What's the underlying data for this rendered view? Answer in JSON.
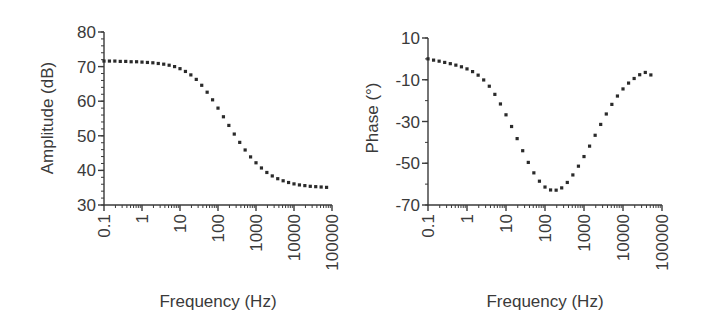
{
  "chart_data": [
    {
      "type": "scatter",
      "title": "",
      "xlabel": "Frequency (Hz)",
      "ylabel": "Amplitude (dB)",
      "xscale": "log",
      "xlim": [
        0.1,
        100000
      ],
      "ylim": [
        30,
        80
      ],
      "xticks": [
        "0.1",
        "1",
        "10",
        "100",
        "1000",
        "10000",
        "100000"
      ],
      "yticks": [
        "30",
        "40",
        "50",
        "60",
        "70",
        "80"
      ],
      "grid": false,
      "legend": null,
      "series": [
        {
          "name": "Amplitude",
          "x": [
            0.1,
            0.139,
            0.193,
            0.268,
            0.373,
            0.518,
            0.72,
            1.0,
            1.39,
            1.93,
            2.68,
            3.73,
            5.18,
            7.2,
            10.0,
            13.9,
            19.3,
            26.8,
            37.3,
            51.8,
            72.0,
            100,
            139,
            193,
            268,
            373,
            518,
            720,
            1000,
            1390,
            1930,
            2680,
            3730,
            5180,
            7200,
            10000,
            13900,
            19300,
            26800,
            37300,
            51800,
            72000
          ],
          "y": [
            71.6,
            71.6,
            71.6,
            71.5,
            71.5,
            71.4,
            71.4,
            71.3,
            71.2,
            71.1,
            70.9,
            70.7,
            70.4,
            70.0,
            69.4,
            68.6,
            67.6,
            66.3,
            64.6,
            62.6,
            60.4,
            58.0,
            55.5,
            53.0,
            50.5,
            48.1,
            45.9,
            43.9,
            42.2,
            40.7,
            39.4,
            38.4,
            37.6,
            37.0,
            36.5,
            36.1,
            35.8,
            35.6,
            35.4,
            35.3,
            35.2,
            35.1
          ]
        }
      ]
    },
    {
      "type": "scatter",
      "title": "",
      "xlabel": "Frequency (Hz)",
      "ylabel": "Phase (°)",
      "xscale": "log",
      "xlim": [
        0.1,
        100000
      ],
      "ylim": [
        -70,
        10
      ],
      "xticks": [
        "0.1",
        "1",
        "10",
        "100",
        "1000",
        "10000",
        "100000"
      ],
      "yticks": [
        "-70",
        "-50",
        "-30",
        "-10",
        "10"
      ],
      "grid": false,
      "legend": null,
      "series": [
        {
          "name": "Phase",
          "x": [
            0.1,
            0.139,
            0.193,
            0.268,
            0.373,
            0.518,
            0.72,
            1.0,
            1.39,
            1.93,
            2.68,
            3.73,
            5.18,
            7.2,
            10.0,
            13.9,
            19.3,
            26.8,
            37.3,
            51.8,
            72.0,
            100,
            139,
            193,
            268,
            373,
            518,
            720,
            1000,
            1390,
            1930,
            2680,
            3730,
            5180,
            7200,
            10000,
            13900,
            19300,
            26800,
            37300,
            51800
          ],
          "y": [
            0.0,
            -0.6,
            -1.1,
            -1.7,
            -2.3,
            -3.0,
            -3.8,
            -4.8,
            -6.1,
            -7.8,
            -10.1,
            -13.1,
            -17.0,
            -21.6,
            -26.8,
            -32.4,
            -38.2,
            -44.0,
            -49.6,
            -54.6,
            -58.6,
            -61.4,
            -62.8,
            -62.9,
            -61.8,
            -59.2,
            -55.6,
            -51.4,
            -46.8,
            -41.8,
            -36.6,
            -31.4,
            -26.4,
            -21.8,
            -17.8,
            -14.4,
            -11.6,
            -9.4,
            -7.6,
            -6.5,
            -7.7
          ]
        }
      ]
    }
  ]
}
